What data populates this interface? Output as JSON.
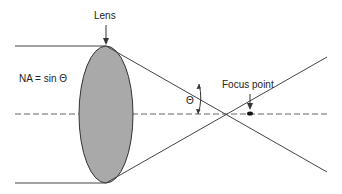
{
  "diagram": {
    "labels": {
      "lens": "Lens",
      "focus_point": "Focus point",
      "na_formula": "NA = sin Θ",
      "angle": "Θ"
    },
    "colors": {
      "lens_fill": "#a9a9a9",
      "line": "#444444",
      "axis_dash": "#666666"
    }
  }
}
